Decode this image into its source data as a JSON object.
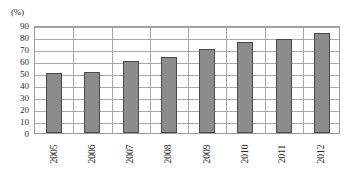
{
  "chart_data": {
    "type": "bar",
    "title": "",
    "subtitle": "",
    "xlabel": "",
    "ylabel": "",
    "unit_label": "(%)",
    "categories": [
      "2005",
      "2006",
      "2007",
      "2008",
      "2009",
      "2010",
      "2011",
      "2012"
    ],
    "values": [
      50,
      51,
      60,
      63,
      70,
      75.5,
      78.5,
      83
    ],
    "series": [
      {
        "name": "",
        "values": [
          50,
          51,
          60,
          63,
          70,
          75.5,
          78.5,
          83
        ]
      }
    ],
    "ylim": [
      0,
      90
    ],
    "ytick_step": 10,
    "ytick_labels": [
      "0",
      "10",
      "20",
      "30",
      "40",
      "50",
      "60",
      "70",
      "80",
      "90"
    ],
    "ytick_values": [
      0,
      10,
      20,
      30,
      40,
      50,
      60,
      70,
      80,
      90
    ],
    "grid": {
      "horizontal": true,
      "vertical": true
    },
    "legend": {
      "visible": false,
      "position": "none",
      "entries": []
    },
    "annotations": [],
    "bar_color": "#8c8c8c",
    "bar_border_color": "#4a4a4a",
    "gridline_color": "#a8a8a8",
    "axis_color": "#555555",
    "plot_border_color": "#9a9a9a",
    "text_color": "#2a2a2a",
    "background_color": "#ffffff",
    "xtick_label_rotation": -90
  }
}
